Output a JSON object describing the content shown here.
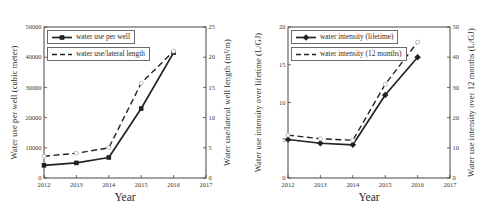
{
  "chart_data": [
    {
      "type": "line",
      "xlabel": "Year",
      "x": [
        2012,
        2013,
        2014,
        2015,
        2016
      ],
      "xlim": [
        2012,
        2017
      ],
      "xticks": [
        2012,
        2013,
        2014,
        2015,
        2016,
        2017
      ],
      "left_axis": {
        "label": "Water use per well (cubic meter)",
        "lim": [
          0,
          50000
        ],
        "ticks": [
          0,
          10000,
          20000,
          30000,
          40000,
          50000
        ]
      },
      "right_axis": {
        "label": "Water use/lateral well length (m³/m)",
        "lim": [
          0,
          25
        ],
        "ticks": [
          0,
          5,
          10,
          15,
          20,
          25
        ]
      },
      "legend_position": "top-left",
      "grid": false,
      "series": [
        {
          "name": "water use per well",
          "axis": "left",
          "line_style": "solid",
          "marker": "square",
          "color": "#222222",
          "values": [
            4200,
            5000,
            6800,
            23000,
            41500
          ]
        },
        {
          "name": "water use/lateral length",
          "axis": "right",
          "line_style": "dashed",
          "marker": "open-circle",
          "color": "#222222",
          "values": [
            3.6,
            4.1,
            5.0,
            15.7,
            21.0
          ]
        }
      ]
    },
    {
      "type": "line",
      "xlabel": "Year",
      "x": [
        2012,
        2013,
        2014,
        2015,
        2016
      ],
      "xlim": [
        2012,
        2017
      ],
      "xticks": [
        2012,
        2013,
        2014,
        2015,
        2016,
        2017
      ],
      "left_axis": {
        "label": "Water use intensity over lifetime (L/GJ)",
        "lim": [
          0,
          20
        ],
        "ticks": [
          0,
          5,
          10,
          15,
          20
        ]
      },
      "right_axis": {
        "label": "Water use intensity over 12 months (L/GJ)",
        "lim": [
          0,
          50
        ],
        "ticks": [
          0,
          10,
          20,
          30,
          40,
          50
        ]
      },
      "legend_position": "top-left",
      "grid": false,
      "series": [
        {
          "name": "water intensity (lifetime)",
          "axis": "left",
          "line_style": "solid",
          "marker": "diamond",
          "color": "#222222",
          "values": [
            5.1,
            4.6,
            4.4,
            11.0,
            16.0
          ]
        },
        {
          "name": "water intensity (12 months)",
          "axis": "right",
          "line_style": "dashed",
          "marker": "open-circle",
          "color": "#222222",
          "values": [
            14.2,
            13.0,
            12.5,
            31.0,
            45.0
          ]
        }
      ]
    }
  ],
  "style": {
    "axis_color": "#444444",
    "line_color": "#222222",
    "open_marker_color": "#b5b5b5",
    "background": "#ffffff"
  }
}
